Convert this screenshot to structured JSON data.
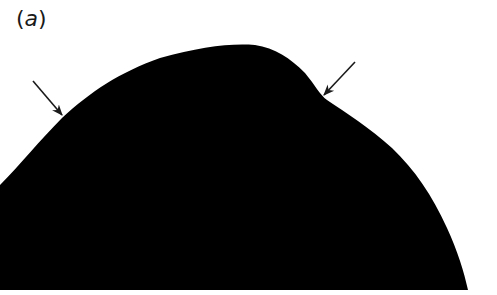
{
  "figure": {
    "panel_label_open": "(",
    "panel_label_letter": "a",
    "panel_label_close": ")",
    "shape_color": "#000000",
    "background_color": "#ffffff",
    "arrow_color": "#1a1a1a",
    "arrows": [
      {
        "name": "left-arrow",
        "from": [
          33,
          81
        ],
        "to": [
          62,
          115
        ]
      },
      {
        "name": "right-arrow",
        "from": [
          355,
          62
        ],
        "to": [
          323,
          95
        ]
      }
    ]
  }
}
